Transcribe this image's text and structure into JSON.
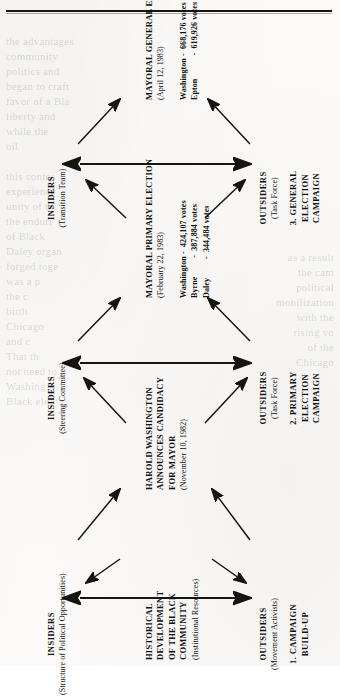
{
  "figure": {
    "phases": [
      {
        "id": "phase-1",
        "label": "1. CAMPAIGN\nBUILD-UP"
      },
      {
        "id": "phase-2",
        "label": "2. PRIMARY\nELECTION\nCAMPAIGN"
      },
      {
        "id": "phase-3",
        "label": "3. GENERAL\nELECTION\nCAMPAIGN"
      }
    ],
    "insiders": [
      {
        "id": "insiders-1",
        "title": "INSIDERS",
        "subtitle": "(Structure of Political Opportunities)"
      },
      {
        "id": "insiders-2",
        "title": "INSIDERS",
        "subtitle": "(Steering Committee)"
      },
      {
        "id": "insiders-3",
        "title": "INSIDERS",
        "subtitle": "(Transition Team)"
      }
    ],
    "outsiders": [
      {
        "id": "outsiders-1",
        "title": "OUTSIDERS",
        "subtitle": "(Movement Activists)"
      },
      {
        "id": "outsiders-2",
        "title": "OUTSIDERS",
        "subtitle": "(Task Force)"
      },
      {
        "id": "outsiders-3",
        "title": "OUTSIDERS",
        "subtitle": "(Task Force)"
      }
    ],
    "events": [
      {
        "id": "event-historical",
        "heading": "HISTORICAL\nDEVELOPMENT\nOF THE BLACK\nCOMMUNITY",
        "meta": "(Institutional Resources)",
        "results": ""
      },
      {
        "id": "event-announcement",
        "heading": "HAROLD WASHINGTON\nANNOUNCES CANDIDACY\nFOR MAYOR",
        "meta": "(November 10, 1982)",
        "results": ""
      },
      {
        "id": "event-primary",
        "heading": "MAYORAL PRIMARY ELECTION",
        "meta": "(February 22, 1983)",
        "results": "Washington -  424,107 votes\nByrne         -  387,884 votes\nDaley         -  344,484 votes"
      },
      {
        "id": "event-general",
        "heading": "MAYORAL GENERAL ELECTION",
        "meta": "(April 12, 1983)",
        "results": "Washington -  668,176 votes\nEpton           -  619,926 votes"
      }
    ],
    "colors": {
      "ink": "#121110",
      "paper": "#fbfaf8",
      "rule": "#15140f"
    }
  },
  "page_bleed": {
    "left_column": "the advantages\ncommunity\npolitics and\nbegan to craft\nfavor of a Bla\nliberty and\nwhile the\noil\n\nthis contes\nexperience\nunity of th\nthe enduri\nof Black\nDaley organ\nforged toge\nwas a p\nthe c\nbirth\nChicago\nand c\nThat th\nnot need to\nWashing\nBlack elec",
    "right_column": "as a result\nthe cam\npolitical\nmobilization\nwith the\nrising vo\nof the\nChicago"
  }
}
